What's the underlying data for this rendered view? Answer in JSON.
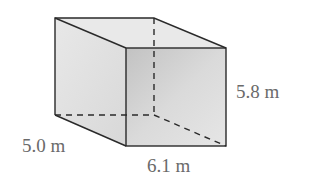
{
  "figure": {
    "type": "rectangular prism",
    "dimensions": {
      "depth_label": "5.0 m",
      "width_label": "6.1 m",
      "height_label": "5.8 m"
    },
    "colors": {
      "edge": "#2a2a2a",
      "label": "#6a6a6a",
      "face_front": "#d6d6d6",
      "face_side": "#e4e4e4",
      "face_top": "#e9e9e9"
    }
  }
}
